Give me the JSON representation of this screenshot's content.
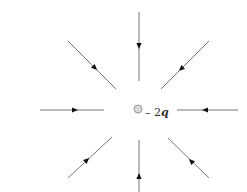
{
  "diagram": {
    "charge": {
      "label_sign": "– 2",
      "label_var": "q",
      "center": [
        138,
        109
      ],
      "radius": 4,
      "fill": "#d8d8d8",
      "stroke": "#888888"
    },
    "line_color": "#777777",
    "arrow_color": "#111111",
    "field_lines": [
      {
        "name": "top",
        "x1": 139,
        "y1": 12,
        "x2": 139,
        "y2": 81,
        "ax": 139,
        "ay": 46
      },
      {
        "name": "upper-right",
        "x1": 209,
        "y1": 41,
        "x2": 161,
        "y2": 89,
        "ax": 181,
        "ay": 69
      },
      {
        "name": "right",
        "x1": 238,
        "y1": 110,
        "x2": 177,
        "y2": 110,
        "ax": 205,
        "ay": 110
      },
      {
        "name": "lower-right",
        "x1": 209,
        "y1": 178,
        "x2": 168,
        "y2": 138,
        "ax": 191,
        "ay": 161
      },
      {
        "name": "bottom",
        "x1": 139,
        "y1": 192,
        "x2": 139,
        "y2": 140,
        "ax": 139,
        "ay": 176
      },
      {
        "name": "lower-left",
        "x1": 68,
        "y1": 178,
        "x2": 112,
        "y2": 137,
        "ax": 87,
        "ay": 160
      },
      {
        "name": "left",
        "x1": 40,
        "y1": 110,
        "x2": 104,
        "y2": 110,
        "ax": 75,
        "ay": 110
      },
      {
        "name": "upper-left",
        "x1": 68,
        "y1": 41,
        "x2": 116,
        "y2": 89,
        "ax": 95,
        "ay": 68
      }
    ]
  }
}
